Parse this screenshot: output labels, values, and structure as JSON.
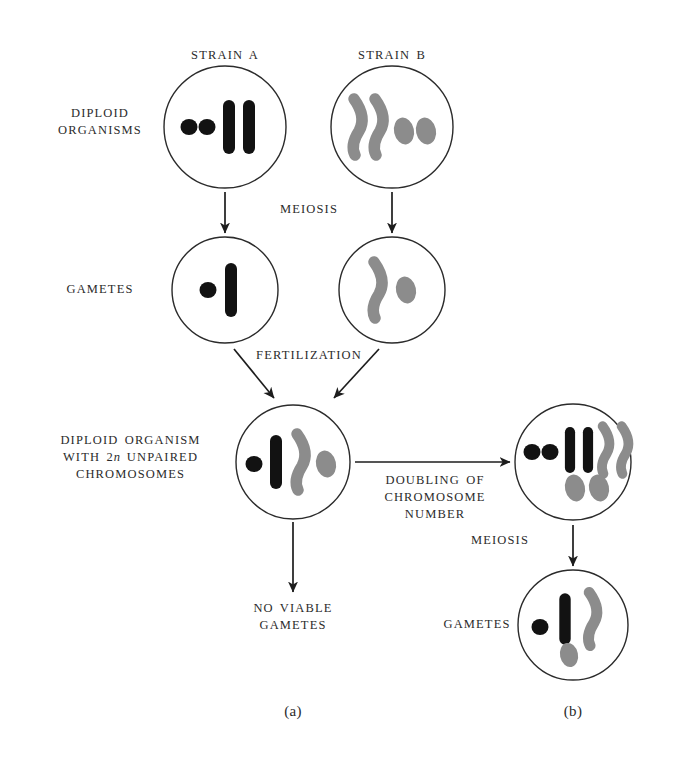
{
  "figure": {
    "background_color": "#ffffff",
    "dark_chromosome_color": "#121212",
    "gray_chromosome_color": "#8c8c8c",
    "outline_color": "#2b2b2b"
  },
  "labels": {
    "strain_a": "STRAIN A",
    "strain_b": "STRAIN B",
    "diploid_organisms": "DIPLOID\nORGANISMS",
    "meiosis_top": "MEIOSIS",
    "gametes_left": "GAMETES",
    "fertilization": "FERTILIZATION",
    "hybrid_organism": "DIPLOID ORGANISM\nWITH 2n UNPAIRED\nCHROMOSOMES",
    "hybrid_organism_line1": "DIPLOID ORGANISM",
    "hybrid_organism_line2_pre": "WITH 2",
    "hybrid_organism_line2_italic": "n",
    "hybrid_organism_line2_post": " UNPAIRED",
    "hybrid_organism_line3": "CHROMOSOMES",
    "doubling": "DOUBLING OF\nCHROMOSOME\nNUMBER",
    "meiosis_right": "MEIOSIS",
    "gametes_right": "GAMETES",
    "no_viable_gametes": "NO VIABLE\nGAMETES",
    "caption_a": "(a)",
    "caption_b": "(b)"
  },
  "cells": [
    {
      "name": "strain-a-diploid-cell",
      "cx": 225,
      "cy": 127,
      "r": 61,
      "chromosomes": [
        {
          "kind": "dot",
          "color": "dark"
        },
        {
          "kind": "dot",
          "color": "dark"
        },
        {
          "kind": "rod",
          "color": "dark"
        },
        {
          "kind": "rod",
          "color": "dark"
        }
      ]
    },
    {
      "name": "strain-b-diploid-cell",
      "cx": 392,
      "cy": 127,
      "r": 61,
      "chromosomes": [
        {
          "kind": "bent",
          "color": "gray"
        },
        {
          "kind": "bent",
          "color": "gray"
        },
        {
          "kind": "oval",
          "color": "gray"
        },
        {
          "kind": "oval",
          "color": "gray"
        }
      ]
    },
    {
      "name": "strain-a-gamete-cell",
      "cx": 225,
      "cy": 290,
      "r": 53,
      "chromosomes": [
        {
          "kind": "dot",
          "color": "dark"
        },
        {
          "kind": "rod",
          "color": "dark"
        }
      ]
    },
    {
      "name": "strain-b-gamete-cell",
      "cx": 392,
      "cy": 290,
      "r": 53,
      "chromosomes": [
        {
          "kind": "bent",
          "color": "gray"
        },
        {
          "kind": "oval",
          "color": "gray"
        }
      ]
    },
    {
      "name": "sterile-hybrid-cell",
      "cx": 293,
      "cy": 462,
      "r": 57,
      "chromosomes": [
        {
          "kind": "dot",
          "color": "dark"
        },
        {
          "kind": "rod",
          "color": "dark"
        },
        {
          "kind": "bent",
          "color": "gray"
        },
        {
          "kind": "oval",
          "color": "gray"
        }
      ]
    },
    {
      "name": "amphidiploid-cell",
      "cx": 573,
      "cy": 462,
      "r": 58,
      "chromosomes": [
        {
          "kind": "dot",
          "color": "dark"
        },
        {
          "kind": "dot",
          "color": "dark"
        },
        {
          "kind": "rod",
          "color": "dark"
        },
        {
          "kind": "rod",
          "color": "dark"
        },
        {
          "kind": "bent",
          "color": "gray"
        },
        {
          "kind": "bent",
          "color": "gray"
        },
        {
          "kind": "oval",
          "color": "gray"
        },
        {
          "kind": "oval",
          "color": "gray"
        }
      ]
    },
    {
      "name": "fertile-gamete-cell",
      "cx": 573,
      "cy": 625,
      "r": 55,
      "chromosomes": [
        {
          "kind": "dot",
          "color": "dark"
        },
        {
          "kind": "rod",
          "color": "dark"
        },
        {
          "kind": "bent",
          "color": "gray"
        },
        {
          "kind": "oval",
          "color": "gray"
        }
      ]
    }
  ],
  "arrows": [
    {
      "name": "arrow-meiosis-strain-a",
      "x1": 225,
      "y1": 192,
      "x2": 225,
      "y2": 233
    },
    {
      "name": "arrow-meiosis-strain-b",
      "x1": 392,
      "y1": 192,
      "x2": 392,
      "y2": 233
    },
    {
      "name": "arrow-fertilization-left",
      "x1": 234,
      "y1": 349,
      "x2": 274,
      "y2": 398
    },
    {
      "name": "arrow-fertilization-right",
      "x1": 379,
      "y1": 349,
      "x2": 334,
      "y2": 398
    },
    {
      "name": "arrow-no-viable-gametes",
      "x1": 293,
      "y1": 522,
      "x2": 293,
      "y2": 592
    },
    {
      "name": "arrow-doubling",
      "x1": 355,
      "y1": 462,
      "x2": 510,
      "y2": 462
    },
    {
      "name": "arrow-meiosis-right",
      "x1": 573,
      "y1": 525,
      "x2": 573,
      "y2": 566
    }
  ]
}
